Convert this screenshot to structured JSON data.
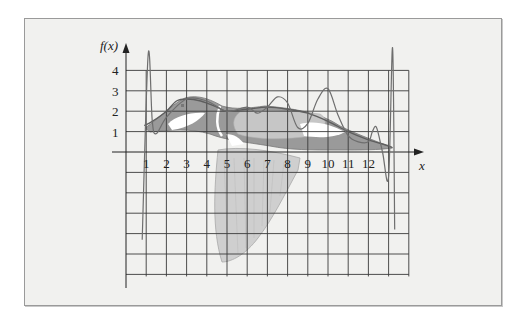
{
  "figure": {
    "y_axis_label": "f(x)",
    "x_axis_label": "x",
    "y_tick_labels": [
      "1",
      "2",
      "3",
      "4"
    ],
    "x_tick_labels": [
      "1",
      "2",
      "3",
      "4",
      "5",
      "6",
      "7",
      "8",
      "9",
      "10",
      "11",
      "12"
    ],
    "colors": {
      "frame_bg": "#f1f1ef",
      "grid": "#3a3a3a",
      "duck_dark": "#8f8f8f",
      "duck_mid": "#b5b5b5",
      "duck_light": "#d4d4d4",
      "duck_white": "#ffffff",
      "curve": "#6a6a6a"
    }
  },
  "chart_data": {
    "type": "line",
    "title": "",
    "xlabel": "x",
    "ylabel": "f(x)",
    "xlim": [
      0,
      14
    ],
    "ylim": [
      -7,
      4
    ],
    "grid": true,
    "x_ticks": [
      1,
      2,
      3,
      4,
      5,
      6,
      7,
      8,
      9,
      10,
      11,
      12
    ],
    "y_ticks": [
      1,
      2,
      3,
      4
    ],
    "background_image": "duck in flight silhouette",
    "series": [
      {
        "name": "smooth interpolant (duck back)",
        "x": [
          0.9,
          1.3,
          2.0,
          2.5,
          3.0,
          3.7,
          4.5,
          5.0,
          6.0,
          7.0,
          8.0,
          9.0,
          10.0,
          11.0,
          12.0,
          13.0,
          13.2
        ],
        "y": [
          1.3,
          1.5,
          2.0,
          2.5,
          2.6,
          2.5,
          2.2,
          2.0,
          2.1,
          2.2,
          2.1,
          1.9,
          1.5,
          1.0,
          0.6,
          0.3,
          0.2
        ]
      },
      {
        "name": "high-degree polynomial interpolant",
        "x": [
          0.8,
          1.1,
          1.3,
          1.5,
          2.0,
          3.0,
          4.0,
          5.0,
          6.0,
          6.5,
          7.0,
          7.5,
          8.0,
          8.5,
          9.0,
          9.5,
          10.0,
          10.5,
          11.0,
          11.5,
          12.0,
          12.2,
          12.4,
          12.7,
          13.0,
          13.2,
          13.3
        ],
        "y": [
          -4.3,
          4.8,
          1.5,
          0.9,
          1.7,
          2.6,
          2.5,
          2.0,
          2.2,
          1.9,
          2.2,
          2.7,
          2.4,
          1.2,
          1.4,
          2.6,
          3.1,
          1.8,
          0.8,
          0.5,
          0.5,
          1.0,
          1.2,
          0.0,
          -1.2,
          5.1,
          -3.8
        ]
      }
    ]
  }
}
